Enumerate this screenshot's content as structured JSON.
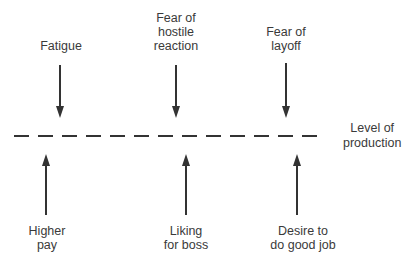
{
  "diagram": {
    "type": "force-field",
    "baseline_label": "Level of\nproduction",
    "restraining_forces": [
      {
        "label": "Fatigue"
      },
      {
        "label": "Fear of\nhostile\nreaction"
      },
      {
        "label": "Fear of\nlayoff"
      }
    ],
    "driving_forces": [
      {
        "label": "Higher\npay"
      },
      {
        "label": "Liking\nfor boss"
      },
      {
        "label": "Desire to\ndo good job"
      }
    ]
  }
}
